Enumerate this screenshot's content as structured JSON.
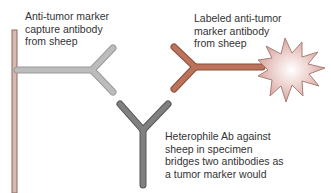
{
  "diagram": {
    "labels": {
      "capture": "Anti-tumor marker\ncapture antibody\nfrom sheep",
      "labeled": "Labeled anti-tumor\nmarker antibody\nfrom sheep",
      "heterophile": "Heterophile Ab against\nsheep in specimen\nbridges two antibodies as\na tumor marker would"
    },
    "colors": {
      "solid_phase": "#d9b8b0",
      "solid_phase_outline": "#8a6a62",
      "capture_antibody": "#b9b9b9",
      "capture_outline": "#9a9a9a",
      "labeled_antibody": "#b8705a",
      "labeled_outline": "#8a4c3a",
      "heterophile_antibody": "#7d7d7d",
      "heterophile_outline": "#555555",
      "label_burst": "#e8c8c4",
      "label_burst_outline": "#a87e78"
    }
  }
}
